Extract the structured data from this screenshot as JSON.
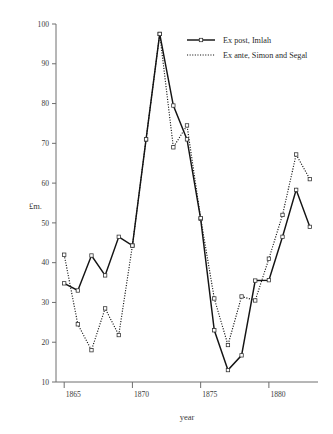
{
  "chart_data": {
    "type": "line",
    "title": "",
    "xlabel": "year",
    "ylabel": "£m.",
    "xlim": [
      1864.4,
      1883.6
    ],
    "ylim": [
      10,
      100
    ],
    "xticks": [
      1865,
      1870,
      1875,
      1880
    ],
    "xticklabels": [
      "1865",
      "1870",
      "1875",
      "1880"
    ],
    "yticks": [
      10,
      20,
      30,
      40,
      50,
      60,
      70,
      80,
      90,
      100
    ],
    "yticklabels": [
      "10",
      "20",
      "30",
      "40",
      "50",
      "60",
      "70",
      "80",
      "90",
      "100"
    ],
    "grid": false,
    "legend_position": "top-right",
    "x": [
      1865,
      1866,
      1867,
      1868,
      1869,
      1870,
      1871,
      1872,
      1873,
      1874,
      1875,
      1876,
      1877,
      1878,
      1879,
      1880,
      1881,
      1882,
      1883
    ],
    "series": [
      {
        "name": "Ex post, Imlah",
        "style": "solid",
        "marker": "square",
        "values": [
          34.8,
          33.0,
          41.8,
          36.8,
          46.5,
          44.3,
          71.0,
          97.5,
          79.5,
          71.0,
          51.0,
          23.0,
          13.0,
          16.7,
          35.5,
          35.6,
          46.5,
          58.3,
          49.0
        ]
      },
      {
        "name": "Ex ante, Simon and Segal",
        "style": "dotted",
        "marker": "square",
        "values": [
          42.0,
          24.5,
          18.0,
          28.5,
          21.8,
          44.3,
          71.0,
          97.5,
          69.0,
          74.5,
          51.2,
          31.0,
          19.3,
          31.5,
          30.5,
          41.0,
          52.0,
          67.2,
          61.0
        ]
      }
    ]
  },
  "legend": {
    "entries": [
      {
        "label": "Ex post, Imlah",
        "style": "solid"
      },
      {
        "label": "Ex ante, Simon and Segal",
        "style": "dotted"
      }
    ]
  },
  "axes": {
    "y_title": "£m.",
    "x_title": "year"
  }
}
